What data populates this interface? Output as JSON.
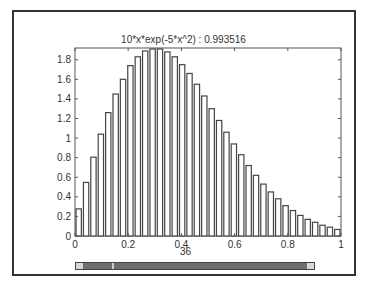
{
  "figure": {
    "title": "10*x*exp(-5*x^2)  :  0.993516",
    "xlabel": "36"
  },
  "scrollbar": {
    "left_arrow": "scroll-left",
    "right_arrow": "scroll-right"
  },
  "chart_data": {
    "type": "bar",
    "title": "10*x*exp(-5*x^2)  :  0.993516",
    "xlabel": "36",
    "ylabel": "",
    "xlim": [
      0,
      1
    ],
    "ylim": [
      0,
      1.9
    ],
    "xticks": [
      "0",
      "0.2",
      "0.4",
      "0.6",
      "0.8",
      "1"
    ],
    "yticks": [
      "0",
      "0.2",
      "0.4",
      "0.6",
      "0.8",
      "1",
      "1.2",
      "1.4",
      "1.6",
      "1.8"
    ],
    "grid": false,
    "x": [
      0.0278,
      0.0556,
      0.0833,
      0.1111,
      0.1389,
      0.1667,
      0.1944,
      0.2222,
      0.25,
      0.2778,
      0.3056,
      0.3333,
      0.3611,
      0.3889,
      0.4167,
      0.4444,
      0.4722,
      0.5,
      0.5278,
      0.5556,
      0.5833,
      0.6111,
      0.6389,
      0.6667,
      0.6944,
      0.7222,
      0.75,
      0.7778,
      0.8056,
      0.8333,
      0.8611,
      0.8889,
      0.9167,
      0.9444,
      0.9722,
      1.0
    ],
    "values": [
      0.277,
      0.547,
      0.805,
      1.04,
      1.26,
      1.45,
      1.6,
      1.74,
      1.83,
      1.89,
      1.91,
      1.91,
      1.88,
      1.83,
      1.75,
      1.66,
      1.55,
      1.43,
      1.3,
      1.18,
      1.06,
      0.94,
      0.83,
      0.72,
      0.62,
      0.53,
      0.45,
      0.38,
      0.31,
      0.26,
      0.21,
      0.17,
      0.14,
      0.11,
      0.09,
      0.067
    ],
    "bar_color": "#ffffff",
    "edge_color": "#444444"
  }
}
